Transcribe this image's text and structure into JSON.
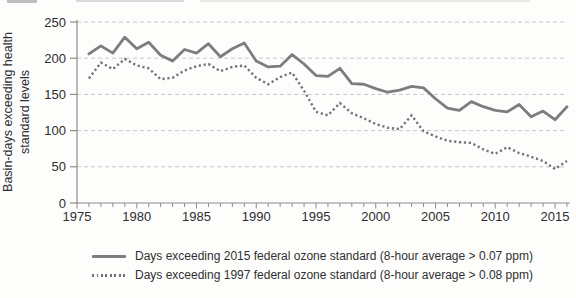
{
  "chart": {
    "y_axis_title_line1": "Basin-days exceeding health",
    "y_axis_title_line2": "standard levels",
    "y_ticks": [
      0,
      50,
      100,
      150,
      200,
      250
    ],
    "x_tick_labels": [
      1975,
      1980,
      1985,
      1990,
      1995,
      2000,
      2005,
      2010,
      2015
    ],
    "colors": {
      "series_solid": "#7d7d7d",
      "series_dotted": "#737373",
      "grid": "#c8c8c8",
      "axis": "#8c8c8c",
      "text": "#2e2e2e"
    }
  },
  "chart_data": {
    "type": "line",
    "title": "",
    "xlabel": "",
    "ylabel": "Basin-days exceeding health standard levels",
    "xlim": [
      1975,
      2016
    ],
    "ylim": [
      0,
      250
    ],
    "grid": "horizontal dashed gridlines at each 50",
    "legend_position": "below chart, left-aligned",
    "x": [
      1976,
      1977,
      1978,
      1979,
      1980,
      1981,
      1982,
      1983,
      1984,
      1985,
      1986,
      1987,
      1988,
      1989,
      1990,
      1991,
      1992,
      1993,
      1994,
      1995,
      1996,
      1997,
      1998,
      1999,
      2000,
      2001,
      2002,
      2003,
      2004,
      2005,
      2006,
      2007,
      2008,
      2009,
      2010,
      2011,
      2012,
      2013,
      2014,
      2015,
      2016
    ],
    "series": [
      {
        "name": "Days exceeding 2015 federal ozone standard (8-hour average > 0.07 ppm)",
        "style": "solid",
        "color": "#7d7d7d",
        "values": [
          206,
          217,
          207,
          229,
          213,
          222,
          204,
          196,
          212,
          207,
          220,
          202,
          213,
          221,
          196,
          188,
          189,
          205,
          192,
          176,
          175,
          186,
          165,
          164,
          158,
          153,
          156,
          161,
          159,
          144,
          131,
          128,
          140,
          133,
          128,
          126,
          136,
          119,
          127,
          115,
          133
        ]
      },
      {
        "name": "Days exceeding 1997 federal ozone standard (8-hour average > 0.08 ppm)",
        "style": "dotted",
        "color": "#737373",
        "values": [
          172,
          194,
          185,
          199,
          190,
          186,
          171,
          173,
          183,
          189,
          192,
          182,
          188,
          190,
          173,
          164,
          174,
          180,
          155,
          126,
          121,
          138,
          124,
          117,
          109,
          104,
          102,
          121,
          99,
          92,
          86,
          84,
          83,
          74,
          68,
          77,
          69,
          64,
          58,
          47,
          58
        ]
      }
    ]
  }
}
